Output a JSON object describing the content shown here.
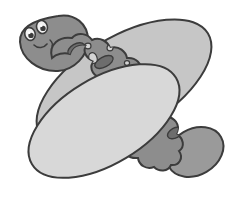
{
  "image": {
    "title": "Cartoon hot dog character",
    "subject": "hot-dog-with-face",
    "style": "grayscale cartoon line art clip-art",
    "background_color": "#ffffff",
    "width": 242,
    "height": 198
  },
  "palette": {
    "outline": "#3c3c3c",
    "bottom_bun_fill": "#d8d8d8",
    "top_bun_fill": "#c6c6c6",
    "sausage_fill": "#8d8d8d",
    "sausage_tip_fill": "#9a9a9a",
    "head_fill": "#8d8d8d",
    "spot_dark_fill": "#6d6d6d",
    "spot_light_fill": "#d4d4d4",
    "eye_white_fill": "#f2f2f2",
    "pupil_fill": "#3c3c3c",
    "highlight_fill": "#ffffff"
  },
  "parts": {
    "top_bun": {
      "label": "Top bun",
      "fill": "#c6c6c6"
    },
    "bottom_bun": {
      "label": "Bottom bun",
      "fill": "#d8d8d8"
    },
    "sausage": {
      "label": "Sausage body",
      "fill": "#8d8d8d"
    },
    "sausage_tip": {
      "label": "Sausage tail end",
      "fill": "#9a9a9a"
    },
    "head": {
      "label": "Sausage head",
      "fill": "#8d8d8d"
    },
    "face": {
      "label": "Face",
      "eyes": 2,
      "mouth": "small smile"
    }
  },
  "sausage_spots": {
    "dark": [
      {
        "cx": 76,
        "cy": 49,
        "rx": 9,
        "ry": 5,
        "rot": -30
      },
      {
        "cx": 104,
        "cy": 62,
        "rx": 10,
        "ry": 5,
        "rot": -28
      },
      {
        "cx": 130,
        "cy": 88,
        "rx": 9,
        "ry": 4.5,
        "rot": -28
      },
      {
        "cx": 150,
        "cy": 116,
        "rx": 7,
        "ry": 4,
        "rot": -30
      },
      {
        "cx": 167,
        "cy": 98,
        "rx": 7,
        "ry": 5,
        "rot": -30
      },
      {
        "cx": 175,
        "cy": 133,
        "rx": 8,
        "ry": 5,
        "rot": -28
      },
      {
        "cx": 147,
        "cy": 81,
        "rx": 4,
        "ry": 3,
        "rot": -25
      },
      {
        "cx": 120,
        "cy": 103,
        "rx": 3.5,
        "ry": 3,
        "rot": -25
      },
      {
        "cx": 91,
        "cy": 82,
        "rx": 3,
        "ry": 2.5,
        "rot": 0
      }
    ],
    "light": [
      {
        "cx": 93,
        "cy": 58,
        "rx": 4,
        "ry": 5.5,
        "rot": -20
      },
      {
        "cx": 114,
        "cy": 84,
        "rx": 3.5,
        "ry": 5,
        "rot": -18
      },
      {
        "cx": 158,
        "cy": 101,
        "rx": 3.5,
        "ry": 4.5,
        "rot": -18
      },
      {
        "cx": 183,
        "cy": 123,
        "rx": 3,
        "ry": 4,
        "rot": -18
      },
      {
        "cx": 88,
        "cy": 46,
        "rx": 3,
        "ry": 2.8,
        "rot": 0
      },
      {
        "cx": 110,
        "cy": 48,
        "rx": 3,
        "ry": 2.8,
        "rot": 0
      },
      {
        "cx": 127,
        "cy": 63,
        "rx": 2.6,
        "ry": 2.4,
        "rot": 0
      },
      {
        "cx": 140,
        "cy": 71,
        "rx": 2.4,
        "ry": 2.2,
        "rot": 0
      },
      {
        "cx": 106,
        "cy": 77,
        "rx": 2.4,
        "ry": 2.2,
        "rot": 0
      },
      {
        "cx": 131,
        "cy": 100,
        "rx": 2.6,
        "ry": 2.4,
        "rot": 0
      },
      {
        "cx": 141,
        "cy": 107,
        "rx": 2.2,
        "ry": 2.0,
        "rot": 0
      },
      {
        "cx": 160,
        "cy": 117,
        "rx": 2.4,
        "ry": 2.2,
        "rot": 0
      },
      {
        "cx": 170,
        "cy": 112,
        "rx": 2.2,
        "ry": 2.0,
        "rot": 0
      },
      {
        "cx": 118,
        "cy": 71,
        "rx": 2.0,
        "ry": 1.9,
        "rot": 0
      }
    ]
  },
  "face_features": {
    "left_eye": {
      "cx": 30,
      "cy": 34,
      "rx": 5.2,
      "ry": 6.4,
      "rot": -15
    },
    "right_eye": {
      "cx": 42,
      "cy": 27,
      "rx": 5.4,
      "ry": 6.6,
      "rot": -15
    },
    "left_pupil": {
      "cx": 31,
      "cy": 35,
      "r": 2.6
    },
    "right_pupil": {
      "cx": 43,
      "cy": 28,
      "r": 2.6
    },
    "left_highlight": {
      "cx": 29.4,
      "cy": 32.6,
      "r": 1.2
    },
    "right_highlight": {
      "cx": 41.4,
      "cy": 25.6,
      "r": 1.2
    },
    "mouth": {
      "label": "smile curve"
    }
  }
}
